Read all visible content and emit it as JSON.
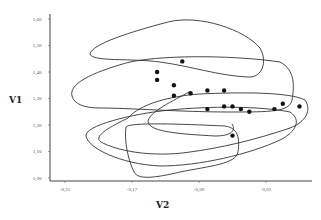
{
  "chart_data": {
    "type": "scatter",
    "title": "",
    "xlabel": "V2",
    "ylabel": "V1",
    "xlim": [
      -0.27,
      0.04
    ],
    "ylim": [
      1.0,
      1.6
    ],
    "x_ticks": [
      "-0.25",
      "-0.17",
      "-0.09",
      "-0.01"
    ],
    "y_ticks": [
      "1.00",
      "1.10",
      "1.20",
      "1.30",
      "1.40",
      "1.50",
      "1.60"
    ],
    "grid": false,
    "legend": null,
    "series": [
      {
        "name": "points",
        "points": [
          {
            "x": -0.11,
            "y": 1.44
          },
          {
            "x": -0.14,
            "y": 1.4
          },
          {
            "x": -0.14,
            "y": 1.37
          },
          {
            "x": -0.12,
            "y": 1.35
          },
          {
            "x": -0.12,
            "y": 1.31
          },
          {
            "x": -0.1,
            "y": 1.32
          },
          {
            "x": -0.08,
            "y": 1.33
          },
          {
            "x": -0.06,
            "y": 1.33
          },
          {
            "x": -0.08,
            "y": 1.26
          },
          {
            "x": -0.06,
            "y": 1.27
          },
          {
            "x": -0.05,
            "y": 1.27
          },
          {
            "x": -0.04,
            "y": 1.26
          },
          {
            "x": -0.03,
            "y": 1.25
          },
          {
            "x": 0.0,
            "y": 1.26
          },
          {
            "x": 0.01,
            "y": 1.28
          },
          {
            "x": 0.03,
            "y": 1.27
          },
          {
            "x": -0.05,
            "y": 1.16
          }
        ]
      }
    ],
    "annotations": [
      "Five overlapping closed contour outlines enclosing regions of the V2–V1 plane"
    ]
  },
  "axes": {
    "x_title": "V2",
    "y_title": "V1"
  }
}
